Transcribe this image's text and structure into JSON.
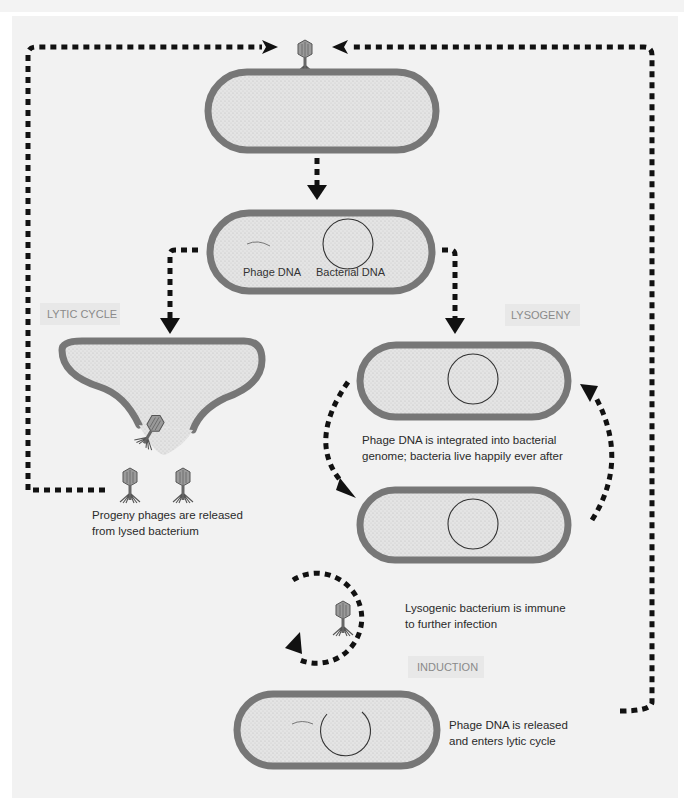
{
  "diagram": {
    "section_labels": {
      "lytic": "LYTIC CYCLE",
      "lysogeny": "LYSOGENY",
      "induction": "INDUCTION"
    },
    "dna_labels": {
      "phage": "Phage DNA",
      "bacterial": "Bacterial DNA"
    },
    "captions": {
      "progeny_line1": "Progeny phages are released",
      "progeny_line2": "from lysed bacterium",
      "integrated_line1": "Phage DNA is integrated into bacterial",
      "integrated_line2": "genome; bacteria live happily ever after",
      "immune_line1": "Lysogenic bacterium is immune",
      "immune_line2": "to further infection",
      "released_line1": "Phage DNA is released",
      "released_line2": "and enters lytic cycle"
    },
    "colors": {
      "membrane": "#7a7a7a",
      "cytoplasm": "#e6e6e6",
      "arrow": "#111111",
      "panel": "#f2f2f2",
      "tag_bg": "#e8e8e8"
    }
  }
}
